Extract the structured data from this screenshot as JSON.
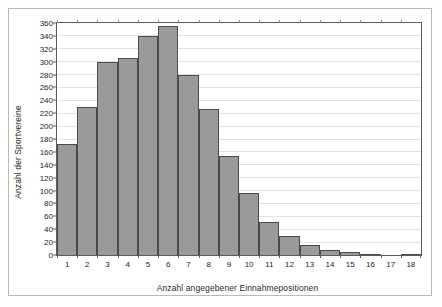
{
  "chart_data": {
    "type": "bar",
    "title": "",
    "subtitle": "",
    "xlabel": "Anzahl angegebener Einnahmepositionen",
    "ylabel": "Anzahl der Sportvereine",
    "categories": [
      "1",
      "2",
      "3",
      "4",
      "5",
      "6",
      "7",
      "8",
      "9",
      "10",
      "11",
      "12",
      "13",
      "14",
      "15",
      "16",
      "17",
      "18"
    ],
    "values": [
      172,
      230,
      300,
      306,
      340,
      355,
      280,
      226,
      154,
      97,
      52,
      29,
      15,
      8,
      4,
      1,
      0,
      2
    ],
    "series": [
      {
        "name": "Anzahl der Sportvereine",
        "values": [
          172,
          230,
          300,
          306,
          340,
          355,
          280,
          226,
          154,
          97,
          52,
          29,
          15,
          8,
          4,
          1,
          0,
          2
        ]
      }
    ],
    "ylim": [
      0,
      360
    ],
    "ytick_step": 20,
    "yticks": [
      0,
      20,
      40,
      60,
      80,
      100,
      120,
      140,
      160,
      180,
      200,
      220,
      240,
      260,
      280,
      300,
      320,
      340,
      360
    ],
    "ytick_labels": [
      "0",
      "20",
      "40",
      "60",
      "80",
      "100",
      "120",
      "140",
      "160",
      "180",
      "200",
      "220",
      "240",
      "260",
      "280",
      "300",
      "320",
      "340",
      "360"
    ],
    "grid": true,
    "grid_axis": "y",
    "legend": false,
    "legend_position": "none",
    "bar_color": "#9a9a9a",
    "bar_edge_color": "#4a4a4a",
    "gridline_color": "#e2e2e2",
    "axis_color": "#5c5c5c",
    "text_color": "#1c1c1c",
    "frame_color": "#b9b9b9",
    "background": "#ffffff"
  }
}
